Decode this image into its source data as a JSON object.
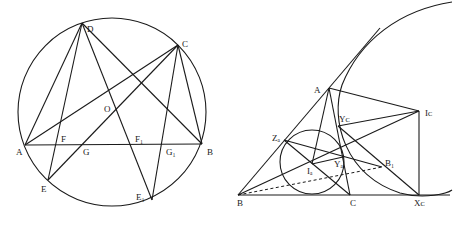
{
  "left_figure": {
    "labels": {
      "D": "D",
      "C": "C",
      "O": "O",
      "A": "A",
      "F": "F",
      "G": "G",
      "F1": "F₁",
      "G1": "G₁",
      "B": "B",
      "E": "E",
      "E1": "E₁"
    }
  },
  "right_figure": {
    "labels": {
      "A": "A",
      "Ic": "Iᴄ",
      "Yc": "Yᴄ",
      "Za": "Zₐ",
      "Ia": "Iₐ",
      "Ya": "Yₐ",
      "B1": "B₁",
      "B": "B",
      "C": "C",
      "Xc": "Xᴄ"
    }
  },
  "colors": {
    "stroke": "#1a1a1a",
    "background": "#ffffff"
  }
}
